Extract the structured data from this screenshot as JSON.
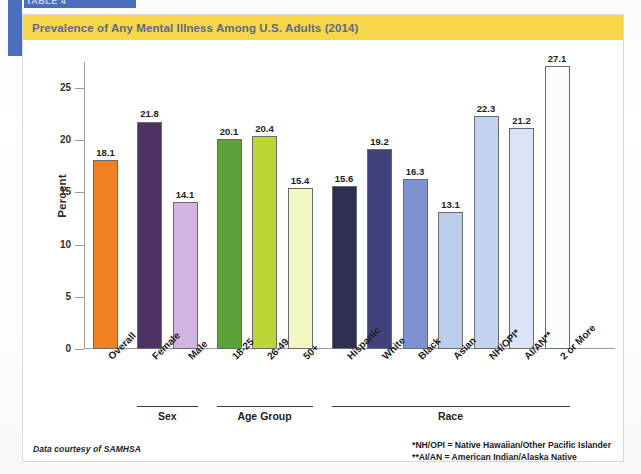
{
  "tab": {
    "label": "TABLE 4"
  },
  "card": {
    "title": "Prevalence of Any Mental Illness Among U.S. Adults (2014)",
    "title_bg": "#f6d64a",
    "title_color": "#5d6b84",
    "accent_blue": "#4a6dbd"
  },
  "source_note": "Data courtesy of SAMHSA",
  "footnotes": [
    "*NH/OPI = Native Hawaiian/Other Pacific Islander",
    "**AI/AN = American Indian/Alaska Native"
  ],
  "groups": [
    {
      "label": "Sex",
      "start": 1,
      "end": 2
    },
    {
      "label": "Age Group",
      "start": 3,
      "end": 5
    },
    {
      "label": "Race",
      "start": 6,
      "end": 12
    }
  ],
  "chart_data": {
    "type": "bar",
    "title": "Prevalence of Any Mental Illness Among U.S. Adults (2014)",
    "xlabel": "",
    "ylabel": "Percent",
    "ylim": [
      0,
      27.5
    ],
    "yticks": [
      0,
      5,
      10,
      15,
      20,
      25
    ],
    "grid": false,
    "legend": "none",
    "categories": [
      "Overall",
      "Female",
      "Male",
      "18-25",
      "26-49",
      "50+",
      "Hispanic",
      "White",
      "Black",
      "Asian",
      "NH/OPI*",
      "AI/AN**",
      "2 or More"
    ],
    "values": [
      18.1,
      21.8,
      14.1,
      20.1,
      20.4,
      15.4,
      15.6,
      19.2,
      16.3,
      13.1,
      22.3,
      21.2,
      27.1
    ],
    "colors": [
      "#f08022",
      "#4e3263",
      "#cfb5e0",
      "#5aa23c",
      "#bcd637",
      "#f2f6c0",
      "#2e2f50",
      "#41427c",
      "#7e92d2",
      "#bccdee",
      "#c3d2f0",
      "#dbe4f6",
      "#fbfcfe"
    ],
    "group_labels": [
      "",
      "Sex",
      "Sex",
      "Age Group",
      "Age Group",
      "Age Group",
      "Race",
      "Race",
      "Race",
      "Race",
      "Race",
      "Race",
      "Race"
    ]
  }
}
